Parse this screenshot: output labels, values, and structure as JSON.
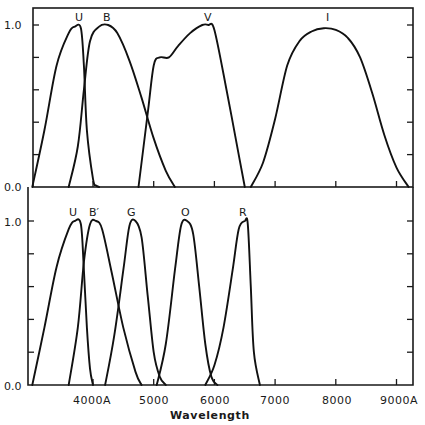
{
  "chart_data": [
    {
      "type": "line",
      "panel": "top",
      "title": "",
      "xlabel": "Wavelength",
      "ylabel": "",
      "xlim": [
        3000,
        9250
      ],
      "ylim": [
        0.0,
        1.1
      ],
      "y_tick_labels": [
        "0.0",
        "1.0"
      ],
      "y_ticks": [
        0.0,
        0.2,
        0.4,
        0.6,
        0.8,
        1.0
      ],
      "grid": false,
      "series": [
        {
          "name": "U",
          "x": [
            3000,
            3200,
            3400,
            3600,
            3700,
            3800,
            3850,
            3900,
            4000,
            4050,
            4100
          ],
          "y": [
            0.0,
            0.35,
            0.75,
            0.95,
            0.99,
            0.98,
            0.75,
            0.35,
            0.05,
            0.01,
            0.0
          ]
        },
        {
          "name": "B",
          "x": [
            3600,
            3750,
            3850,
            3950,
            4100,
            4250,
            4400,
            4600,
            4800,
            5000,
            5200,
            5350
          ],
          "y": [
            0.0,
            0.25,
            0.6,
            0.9,
            0.99,
            1.0,
            0.95,
            0.78,
            0.55,
            0.3,
            0.1,
            0.0
          ]
        },
        {
          "name": "V",
          "x": [
            4750,
            4900,
            5000,
            5100,
            5250,
            5400,
            5600,
            5800,
            5900,
            6000,
            6200,
            6400,
            6500
          ],
          "y": [
            0.0,
            0.45,
            0.75,
            0.8,
            0.8,
            0.87,
            0.95,
            1.0,
            1.0,
            0.97,
            0.6,
            0.2,
            0.0
          ]
        },
        {
          "name": "I",
          "x": [
            6600,
            6800,
            7000,
            7200,
            7400,
            7600,
            7800,
            8000,
            8200,
            8400,
            8600,
            8800,
            9000,
            9200
          ],
          "y": [
            0.0,
            0.15,
            0.42,
            0.75,
            0.9,
            0.96,
            0.98,
            0.97,
            0.92,
            0.8,
            0.58,
            0.32,
            0.12,
            0.0
          ]
        }
      ]
    },
    {
      "type": "line",
      "panel": "bottom",
      "title": "",
      "xlabel": "Wavelength",
      "ylabel": "",
      "xlim": [
        3000,
        9250
      ],
      "ylim": [
        0.0,
        1.1
      ],
      "y_tick_labels": [
        "0.0",
        "1.0"
      ],
      "y_ticks": [
        0.0,
        0.2,
        0.4,
        0.6,
        0.8,
        1.0
      ],
      "x_tick_labels": [
        "4000A",
        "5000",
        "6000",
        "7000",
        "8000",
        "9000A"
      ],
      "x_ticks": [
        4000,
        5000,
        6000,
        7000,
        8000,
        9000
      ],
      "grid": false,
      "series": [
        {
          "name": "U",
          "x": [
            3000,
            3200,
            3400,
            3600,
            3700,
            3800,
            3850,
            3900,
            3950,
            4000
          ],
          "y": [
            0.0,
            0.35,
            0.72,
            0.95,
            1.0,
            0.98,
            0.7,
            0.35,
            0.1,
            0.0
          ]
        },
        {
          "name": "B'",
          "x": [
            3600,
            3750,
            3850,
            3950,
            4050,
            4150,
            4300,
            4500,
            4700,
            4800
          ],
          "y": [
            0.0,
            0.35,
            0.75,
            0.98,
            1.0,
            0.95,
            0.7,
            0.35,
            0.08,
            0.0
          ]
        },
        {
          "name": "G",
          "x": [
            4200,
            4350,
            4500,
            4600,
            4700,
            4800,
            4900,
            5000,
            5100,
            5200
          ],
          "y": [
            0.0,
            0.3,
            0.7,
            0.97,
            1.0,
            0.9,
            0.55,
            0.2,
            0.05,
            0.0
          ]
        },
        {
          "name": "O",
          "x": [
            5050,
            5200,
            5350,
            5450,
            5550,
            5650,
            5750,
            5850,
            5950,
            6050
          ],
          "y": [
            0.0,
            0.25,
            0.7,
            0.97,
            1.0,
            0.92,
            0.6,
            0.25,
            0.05,
            0.0
          ]
        },
        {
          "name": "R",
          "x": [
            5850,
            6000,
            6150,
            6300,
            6400,
            6500,
            6550,
            6600,
            6650,
            6750
          ],
          "y": [
            0.0,
            0.12,
            0.35,
            0.7,
            0.95,
            1.0,
            0.98,
            0.6,
            0.2,
            0.0
          ]
        }
      ]
    }
  ],
  "axes": {
    "x_title": "Wavelength",
    "x_tick_labels": [
      "4000A",
      "5000",
      "6000",
      "7000",
      "8000",
      "9000A"
    ],
    "top_panel": {
      "y_labels": [
        "1.0",
        "0.0"
      ],
      "curve_labels": [
        "U",
        "B",
        "V",
        "I"
      ]
    },
    "bottom_panel": {
      "y_labels": [
        "1.0",
        "0.0"
      ],
      "curve_labels": [
        "U",
        "B′",
        "G",
        "O",
        "R"
      ]
    }
  }
}
